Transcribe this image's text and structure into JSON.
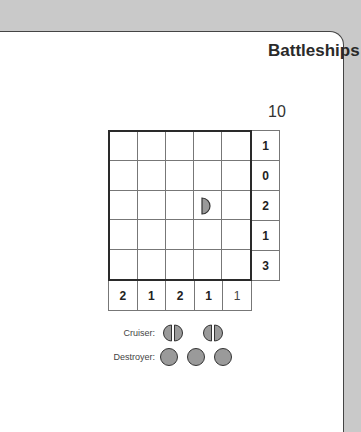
{
  "title": "Battleships",
  "puzzle_number": "10",
  "grid": {
    "rows": 5,
    "cols": 5,
    "cells": [
      [
        "",
        "",
        "",
        "",
        ""
      ],
      [
        "",
        "",
        "",
        "",
        ""
      ],
      [
        "",
        "",
        "",
        "ship-end-right",
        ""
      ],
      [
        "",
        "",
        "",
        "",
        ""
      ],
      [
        "",
        "",
        "",
        "",
        ""
      ]
    ]
  },
  "row_clues": [
    "1",
    "0",
    "2",
    "1",
    "3"
  ],
  "col_clues": [
    "2",
    "1",
    "2",
    "1",
    "1"
  ],
  "fleet": {
    "cruiser": {
      "label": "Cruiser:",
      "count": 2,
      "icon": "cruiser-ship-icon"
    },
    "destroyer": {
      "label": "Destroyer:",
      "count": 3,
      "icon": "destroyer-ship-icon"
    }
  },
  "colors": {
    "background": "#c9c9c9",
    "card": "#ffffff",
    "ship_fill": "#9a9a9a",
    "ship_stroke": "#333333",
    "grid_line": "#777777",
    "grid_border": "#2a2a2a"
  }
}
